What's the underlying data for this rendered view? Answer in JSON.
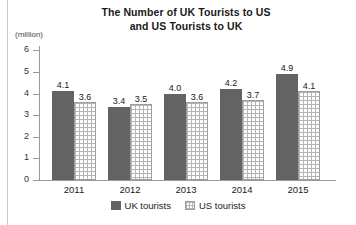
{
  "chart_data": {
    "type": "bar",
    "title": "The Number of UK Tourists to US and US Tourists to UK",
    "title_lines": [
      "The Number of UK Tourists to US",
      "and US Tourists to UK"
    ],
    "xlabel": "",
    "ylabel": "(million)",
    "unit_label": "(million)",
    "categories": [
      "2011",
      "2012",
      "2013",
      "2014",
      "2015"
    ],
    "ylim": [
      0,
      6
    ],
    "ytick_labels": [
      "0",
      "1",
      "2",
      "3",
      "4",
      "5",
      "6"
    ],
    "yticks": [
      0,
      1,
      2,
      3,
      4,
      5,
      6
    ],
    "grid": false,
    "legend_position": "bottom-center",
    "series": [
      {
        "name": "UK tourists",
        "color": "#636363",
        "fill": "solid",
        "values": [
          4.1,
          3.4,
          4.0,
          4.2,
          4.9
        ],
        "labels": [
          "4.1",
          "3.4",
          "4.0",
          "4.2",
          "4.9"
        ]
      },
      {
        "name": "US tourists",
        "color": "#b4b4b4",
        "fill": "grid-hatch",
        "values": [
          3.6,
          3.5,
          3.6,
          3.7,
          4.1
        ],
        "labels": [
          "3.6",
          "3.5",
          "3.6",
          "3.7",
          "4.1"
        ]
      }
    ]
  }
}
